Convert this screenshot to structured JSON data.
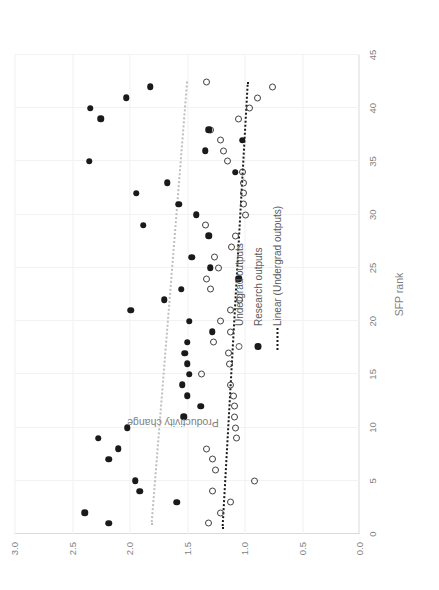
{
  "chart_data": {
    "type": "scatter",
    "title": "",
    "xlabel": "SFP rank",
    "ylabel": "Productivity change",
    "xlim": [
      0,
      45
    ],
    "ylim": [
      0.0,
      3.0
    ],
    "xticks": [
      "0",
      "5",
      "10",
      "15",
      "20",
      "25",
      "30",
      "35",
      "40",
      "45"
    ],
    "yticks": [
      "0.0",
      "0.5",
      "1.0",
      "1.5",
      "2.0",
      "2.5",
      "3.0"
    ],
    "grid": "both",
    "legend_position": "inside-left",
    "legend": [
      {
        "key": "open-circle",
        "label": "Undergrad outputs"
      },
      {
        "key": "filled-circle",
        "label": "Research outputs"
      },
      {
        "key": "dotted-line",
        "label": "Linear (Undergrad outputs)"
      }
    ],
    "colors": {
      "undergrad_marker": "#404040",
      "research_marker": "#1a1a1a",
      "undergrad_trend": "#1a1a1a",
      "research_trend": "#bfbfbf",
      "gridline": "#f2f2f2",
      "axis": "#d9d9d9",
      "text": "#7f7f7f"
    },
    "series": [
      {
        "name": "Undergrad outputs",
        "marker": "open-circle",
        "points": [
          [
            1,
            1.31
          ],
          [
            2,
            1.21
          ],
          [
            3,
            1.12
          ],
          [
            4,
            1.28
          ],
          [
            5,
            0.91
          ],
          [
            6,
            1.25
          ],
          [
            7,
            1.28
          ],
          [
            8,
            1.33
          ],
          [
            9,
            1.07
          ],
          [
            10,
            1.08
          ],
          [
            11,
            1.09
          ],
          [
            12,
            1.09
          ],
          [
            13,
            1.1
          ],
          [
            14,
            1.12
          ],
          [
            15,
            1.37
          ],
          [
            16,
            1.13
          ],
          [
            17,
            1.14
          ],
          [
            18,
            1.27
          ],
          [
            19,
            1.12
          ],
          [
            20,
            1.21
          ],
          [
            21,
            1.12
          ],
          [
            22,
            1.04
          ],
          [
            23,
            1.3
          ],
          [
            24,
            1.33
          ],
          [
            25,
            1.23
          ],
          [
            26,
            1.26
          ],
          [
            27,
            1.11
          ],
          [
            28,
            1.08
          ],
          [
            29,
            1.34
          ],
          [
            30,
            0.99
          ],
          [
            31,
            1.01
          ],
          [
            32,
            1.01
          ],
          [
            33,
            1.01
          ],
          [
            34,
            1.02
          ],
          [
            35,
            1.15
          ],
          [
            36,
            1.18
          ],
          [
            37,
            1.21
          ],
          [
            38,
            1.3
          ],
          [
            39,
            1.05
          ],
          [
            40,
            0.96
          ],
          [
            41,
            0.89
          ],
          [
            42,
            0.76
          ],
          [
            42.5,
            1.33
          ]
        ]
      },
      {
        "name": "Research outputs",
        "marker": "filled-circle",
        "points": [
          [
            1,
            2.18
          ],
          [
            2,
            2.39
          ],
          [
            3,
            1.59
          ],
          [
            4,
            1.91
          ],
          [
            5,
            1.95
          ],
          [
            7,
            2.18
          ],
          [
            8,
            2.1
          ],
          [
            9,
            2.27
          ],
          [
            10,
            2.02
          ],
          [
            11,
            1.53
          ],
          [
            12,
            1.38
          ],
          [
            13,
            1.5
          ],
          [
            14,
            1.54
          ],
          [
            15,
            1.48
          ],
          [
            16,
            1.5
          ],
          [
            17,
            1.52
          ],
          [
            18,
            1.5
          ],
          [
            19,
            1.28
          ],
          [
            20,
            1.48
          ],
          [
            21,
            1.99
          ],
          [
            22,
            1.7
          ],
          [
            23,
            1.55
          ],
          [
            24,
            1.05
          ],
          [
            25,
            1.3
          ],
          [
            26,
            1.46
          ],
          [
            28,
            1.31
          ],
          [
            29,
            1.88
          ],
          [
            30,
            1.42
          ],
          [
            31,
            1.57
          ],
          [
            32,
            1.94
          ],
          [
            33,
            1.67
          ],
          [
            34,
            1.08
          ],
          [
            35,
            2.35
          ],
          [
            36,
            1.34
          ],
          [
            37,
            1.02
          ],
          [
            38,
            1.31
          ],
          [
            39,
            2.25
          ],
          [
            40,
            2.34
          ],
          [
            41,
            2.03
          ],
          [
            42,
            1.82
          ]
        ]
      }
    ],
    "trendlines": [
      {
        "name": "Linear (Undergrad outputs)",
        "style": "dotted",
        "color": "#1a1a1a",
        "x0": 0.5,
        "y0": 1.2,
        "x1": 42.5,
        "y1": 0.98
      },
      {
        "name": "Linear (Research outputs)",
        "style": "dotted",
        "color": "#bfbfbf",
        "x0": 0.8,
        "y0": 1.82,
        "x1": 42.5,
        "y1": 1.51
      }
    ]
  }
}
